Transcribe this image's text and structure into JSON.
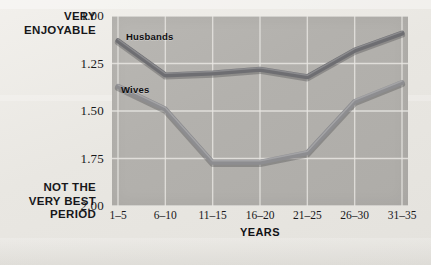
{
  "chart_data": {
    "type": "line",
    "title": "",
    "xlabel": "YEARS",
    "ylabel": "",
    "categories": [
      "1–5",
      "6–10",
      "11–15",
      "16–20",
      "21–25",
      "26–30",
      "31–35"
    ],
    "ylim": [
      1.0,
      2.0
    ],
    "y_inverted": true,
    "yticks": [
      "1.00",
      "1.25",
      "1.50",
      "1.75",
      "2.00"
    ],
    "ytick_values": [
      1.0,
      1.25,
      1.5,
      1.75,
      2.0
    ],
    "grid": true,
    "legend": "inline-labels",
    "y_axis_top_label": "VERY ENJOYABLE",
    "y_axis_bottom_label": "NOT THE VERY BEST PERIOD",
    "series": [
      {
        "name": "Husbands",
        "color": "#6e6e72",
        "values": [
          1.13,
          1.31,
          1.3,
          1.28,
          1.32,
          1.18,
          1.09
        ]
      },
      {
        "name": "Wives",
        "color": "#8d8d90",
        "values": [
          1.37,
          1.49,
          1.77,
          1.77,
          1.72,
          1.45,
          1.35
        ]
      }
    ]
  },
  "axis_labels": {
    "top_line1": "VERY",
    "top_line2": "ENJOYABLE",
    "bottom_line1": "NOT THE",
    "bottom_line2": "VERY BEST",
    "bottom_line3": "PERIOD"
  },
  "colors": {
    "page_background": "#eceae6",
    "plot_background": "#b5b3af",
    "gridline": "#e9e7e3",
    "husbands_line": "#6e6e72",
    "wives_line": "#8d8d90",
    "text": "#17171a"
  }
}
